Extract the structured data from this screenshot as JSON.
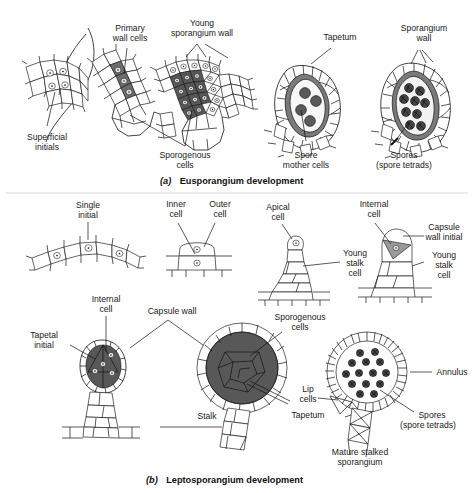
{
  "figure": {
    "panels": [
      {
        "id": "a",
        "caption_tag": "(a)",
        "caption_text": "Eusporangium development",
        "labels": [
          {
            "key": "superficial_initials",
            "text_lines": [
              "Superficial",
              "initials"
            ]
          },
          {
            "key": "primary_wall_cells",
            "text_lines": [
              "Primary",
              "wall cells"
            ]
          },
          {
            "key": "young_sporangium_wall",
            "text_lines": [
              "Young",
              "sporangium wall"
            ]
          },
          {
            "key": "tapetum",
            "text_lines": [
              "Tapetum"
            ]
          },
          {
            "key": "sporangium_wall",
            "text_lines": [
              "Sporangium",
              "wall"
            ]
          },
          {
            "key": "sporogenous_cells",
            "text_lines": [
              "Sporogenous",
              "cells"
            ]
          },
          {
            "key": "spore_mother_cells",
            "text_lines": [
              "Spore",
              "mother cells"
            ]
          },
          {
            "key": "spores_tetrads",
            "text_lines": [
              "Spores",
              "(spore tetrads)"
            ]
          }
        ]
      },
      {
        "id": "b",
        "caption_tag": "(b)",
        "caption_text": "Leptosporangium development",
        "labels": [
          {
            "key": "single_initial",
            "text_lines": [
              "Single",
              "initial"
            ]
          },
          {
            "key": "inner_cell",
            "text_lines": [
              "Inner",
              "cell"
            ]
          },
          {
            "key": "outer_cell",
            "text_lines": [
              "Outer",
              "cell"
            ]
          },
          {
            "key": "apical_cell",
            "text_lines": [
              "Apical",
              "cell"
            ]
          },
          {
            "key": "young_stalk_cell_1",
            "text_lines": [
              "Young",
              "stalk",
              "cell"
            ]
          },
          {
            "key": "internal_cell_top",
            "text_lines": [
              "Internal",
              "cell"
            ]
          },
          {
            "key": "capsule_wall_initial",
            "text_lines": [
              "Capsule",
              "wall initial"
            ]
          },
          {
            "key": "young_stalk_cell_2",
            "text_lines": [
              "Young",
              "stalk",
              "cell"
            ]
          },
          {
            "key": "internal_cell_bottom",
            "text_lines": [
              "Internal",
              "cell"
            ]
          },
          {
            "key": "capsule_wall",
            "text_lines": [
              "Capsule wall"
            ]
          },
          {
            "key": "sporogenous_cells_b",
            "text_lines": [
              "Sporogenous",
              "cells"
            ]
          },
          {
            "key": "tapetal_initial",
            "text_lines": [
              "Tapetal",
              "initial"
            ]
          },
          {
            "key": "stalk",
            "text_lines": [
              "Stalk"
            ]
          },
          {
            "key": "tapetum_b",
            "text_lines": [
              "Tapetum"
            ]
          },
          {
            "key": "annulus",
            "text_lines": [
              "Annulus"
            ]
          },
          {
            "key": "lip_cells",
            "text_lines": [
              "Lip",
              "cells"
            ]
          },
          {
            "key": "spores_tetrads_b",
            "text_lines": [
              "Spores",
              "(spore tetrads)"
            ]
          },
          {
            "key": "mature_stalked_sporangium",
            "text_lines": [
              "Mature stalked",
              "sporangium"
            ]
          }
        ]
      }
    ],
    "colors": {
      "ink": "#111111",
      "cell_fill": "#fdfdfd",
      "sporogenous_dark": "#585858",
      "tapetum_gray": "#7a7a7a",
      "capsule_initial_gray": "#9a9a9a",
      "spore_fill": "#5a5a5a",
      "background": "#ffffff"
    }
  }
}
